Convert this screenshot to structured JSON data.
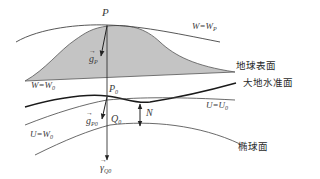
{
  "diagram": {
    "title": "",
    "colors": {
      "terrain_fill": "#c4c4c4",
      "stroke": "#333333",
      "geoid_stroke": "#1a1a1a",
      "label": "#3a3a3a"
    },
    "surfaces": [
      {
        "id": "earth-surface",
        "label": "地球表面"
      },
      {
        "id": "geoid",
        "label": "大地水准面"
      },
      {
        "id": "ellipsoid",
        "label": "椭球面"
      }
    ],
    "equipotential_labels": {
      "w_p": {
        "main": "W=W",
        "sub": "P"
      },
      "w_0": {
        "main": "W=W",
        "sub": "0"
      },
      "u_u0": {
        "main": "U=U",
        "sub": "0"
      },
      "u_w0": {
        "main": "U=W",
        "sub": "0"
      }
    },
    "points": {
      "p": {
        "main": "P",
        "sub": ""
      },
      "p0": {
        "main": "P",
        "sub": "0"
      },
      "q0": {
        "main": "Q",
        "sub": "0"
      }
    },
    "vectors": {
      "g_p": {
        "main": "g",
        "sub": "P"
      },
      "g_p0": {
        "main": "g",
        "sub": "P0"
      },
      "gamma_q0": {
        "main": "γ",
        "sub": "Q0"
      }
    },
    "measures": {
      "n": "N"
    }
  }
}
